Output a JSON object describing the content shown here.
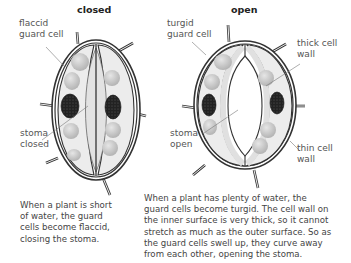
{
  "closed_diagram": {
    "title": "closed",
    "labels": {
      "guard_cell": [
        "flaccid",
        "guard cell"
      ],
      "stoma": [
        "stoma",
        "closed"
      ]
    },
    "caption": [
      "When a plant is short",
      "of water, the guard",
      "cells become flaccid,",
      "closing the stoma."
    ]
  },
  "open_diagram": {
    "title": "open",
    "labels": {
      "guard_cell": [
        "turgid",
        "guard cell"
      ],
      "thick_wall": [
        "thick cell",
        "wall"
      ],
      "stoma": [
        "stoma",
        "open"
      ],
      "thin_wall": [
        "thin cell",
        "wall"
      ]
    },
    "caption": [
      "When a plant has plenty of water, the",
      "guard cells become turgid. The cell wall on",
      "the inner surface is very thick, so it cannot",
      "stretch as much as the outer surface. So as",
      "the guard cells swell up, they curve away",
      "from each other, opening the stoma."
    ]
  },
  "colors": {
    "cell_fill": "#ececec",
    "inner_fill": "#f6f6f6",
    "chloroplast": "#c8c8c8",
    "nucleus": "#2a2a2a",
    "outline": "#333333",
    "leader": "#777777"
  }
}
